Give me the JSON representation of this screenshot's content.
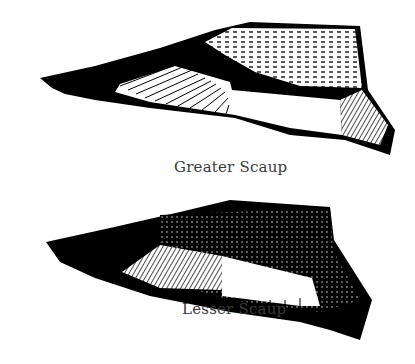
{
  "figure": {
    "wings": [
      {
        "label": "Greater Scaup",
        "caption_pos": [
          174,
          158
        ]
      },
      {
        "label": "Lesser Scaup",
        "caption_pos": [
          182,
          300
        ]
      }
    ],
    "colors": {
      "ink": "#000000",
      "paper": "#ffffff",
      "caption": "#3a3a3a"
    }
  }
}
